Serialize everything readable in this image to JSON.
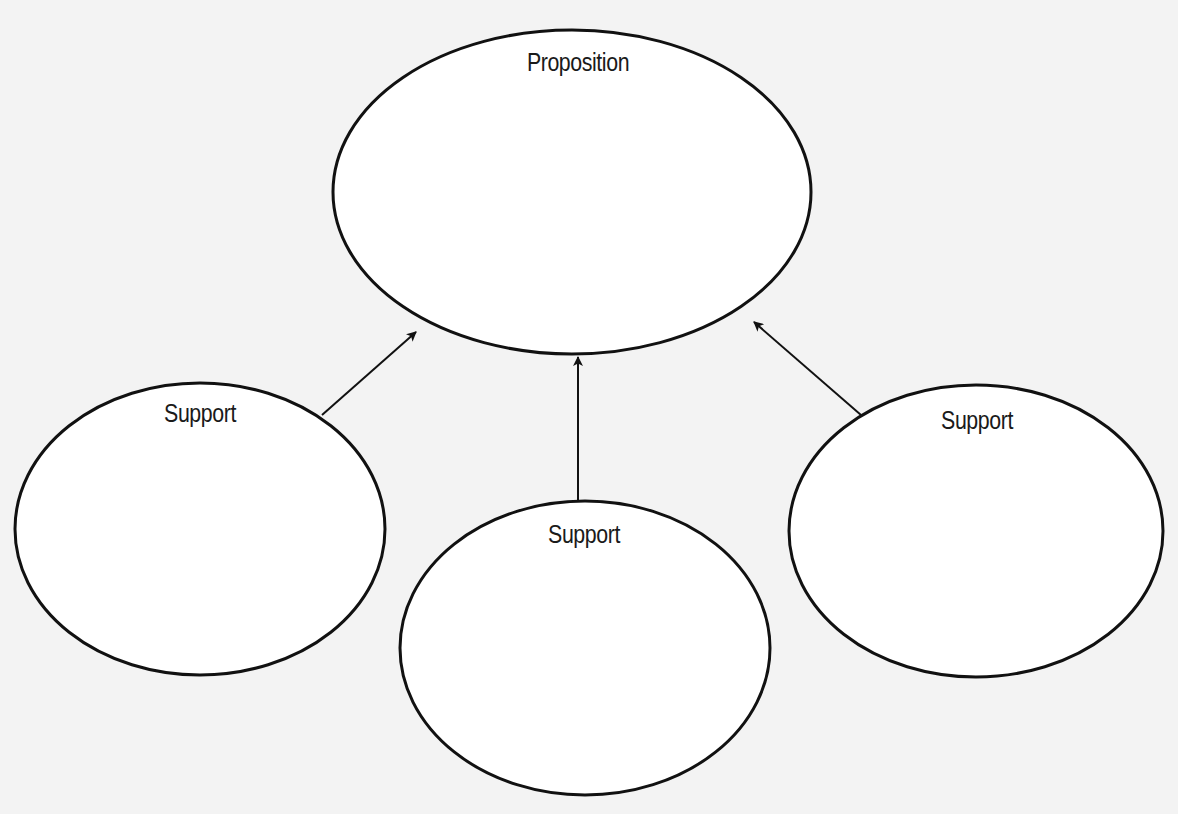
{
  "diagram": {
    "type": "argument-map",
    "nodes": [
      {
        "id": "proposition",
        "label": "Proposition",
        "cx": 572,
        "cy": 192,
        "rx": 239,
        "ry": 162,
        "label_x": 578,
        "label_y": 47
      },
      {
        "id": "support-left",
        "label": "Support",
        "cx": 200,
        "cy": 529,
        "rx": 185,
        "ry": 146,
        "label_x": 200,
        "label_y": 398
      },
      {
        "id": "support-middle",
        "label": "Support",
        "cx": 585,
        "cy": 648,
        "rx": 185,
        "ry": 147,
        "label_x": 584,
        "label_y": 519
      },
      {
        "id": "support-right",
        "label": "Support",
        "cx": 976,
        "cy": 531,
        "rx": 187,
        "ry": 146,
        "label_x": 977,
        "label_y": 405
      }
    ],
    "edges": [
      {
        "from": "support-left",
        "to": "proposition",
        "x1": 322,
        "y1": 415,
        "x2": 416,
        "y2": 332
      },
      {
        "from": "support-middle",
        "to": "proposition",
        "x1": 578,
        "y1": 501,
        "x2": 578,
        "y2": 357
      },
      {
        "from": "support-right",
        "to": "proposition",
        "x1": 861,
        "y1": 415,
        "x2": 754,
        "y2": 322
      }
    ],
    "stroke_color": "#111111",
    "fill_color": "#ffffff"
  }
}
